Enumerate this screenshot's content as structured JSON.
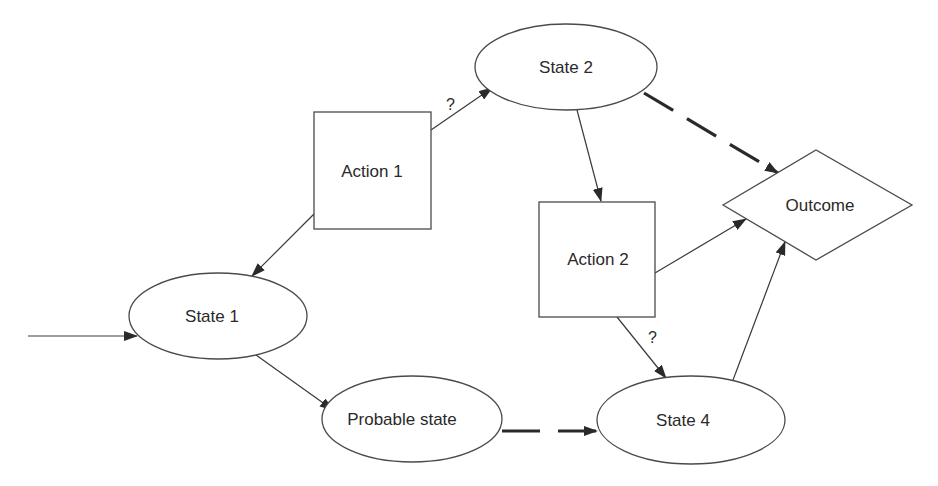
{
  "diagram": {
    "nodes": [
      {
        "id": "state2",
        "label": "State 2",
        "shape": "ellipse"
      },
      {
        "id": "action1",
        "label": "Action 1",
        "shape": "rectangle"
      },
      {
        "id": "state1",
        "label": "State 1",
        "shape": "ellipse"
      },
      {
        "id": "action2",
        "label": "Action 2",
        "shape": "rectangle"
      },
      {
        "id": "outcome",
        "label": "Outcome",
        "shape": "diamond"
      },
      {
        "id": "probable",
        "label": "Probable state",
        "shape": "ellipse"
      },
      {
        "id": "state4",
        "label": "State 4",
        "shape": "ellipse"
      }
    ],
    "edges": [
      {
        "from": "entry",
        "to": "state1",
        "style": "solid",
        "label": ""
      },
      {
        "from": "action1",
        "to": "state2",
        "style": "solid",
        "label": "?"
      },
      {
        "from": "action1",
        "to": "state1",
        "style": "solid",
        "label": ""
      },
      {
        "from": "state2",
        "to": "action2",
        "style": "solid",
        "label": ""
      },
      {
        "from": "state2",
        "to": "outcome",
        "style": "dashed",
        "label": ""
      },
      {
        "from": "action2",
        "to": "outcome",
        "style": "solid",
        "label": ""
      },
      {
        "from": "action2",
        "to": "state4",
        "style": "solid",
        "label": "?"
      },
      {
        "from": "state4",
        "to": "outcome",
        "style": "solid",
        "label": ""
      },
      {
        "from": "state1",
        "to": "probable",
        "style": "solid",
        "label": ""
      },
      {
        "from": "probable",
        "to": "state4",
        "style": "dashed",
        "label": ""
      }
    ],
    "edge_labels": {
      "action1_state2": "?",
      "action2_state4": "?"
    },
    "colors": {
      "stroke": "#4a4a4a",
      "arrow": "#2a2a2a",
      "background": "#ffffff"
    }
  }
}
